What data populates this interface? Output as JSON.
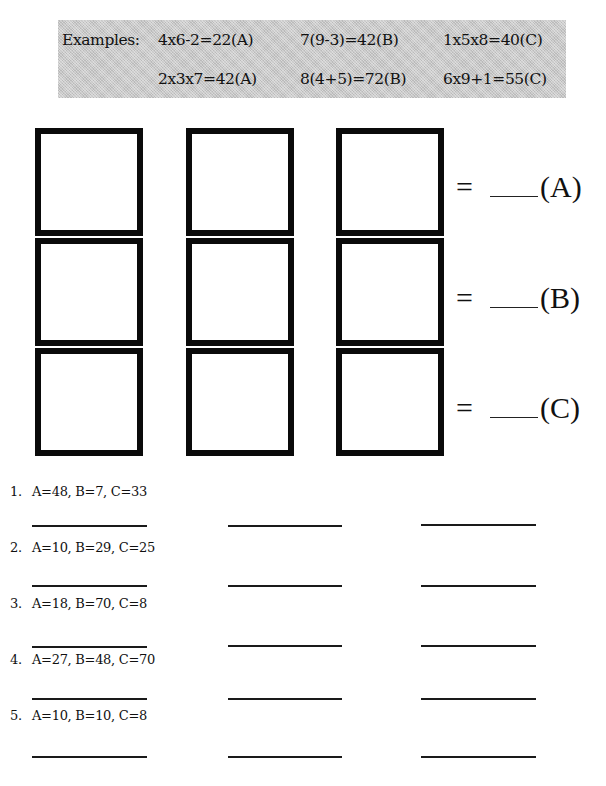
{
  "examples": {
    "label": "Examples:",
    "rows": [
      [
        "4x6-2=22(A)",
        "7(9-3)=42(B)",
        "1x5x8=40(C)"
      ],
      [
        "2x3x7=42(A)",
        "8(4+5)=72(B)",
        "6x9+1=55(C)"
      ]
    ]
  },
  "grid": {
    "rows": 3,
    "cols": 3,
    "equations": [
      {
        "sign": "=",
        "label": "(A)"
      },
      {
        "sign": "=",
        "label": "(B)"
      },
      {
        "sign": "=",
        "label": "(C)"
      }
    ]
  },
  "problems": [
    {
      "number": "1.",
      "text": "A=48, B=7, C=33"
    },
    {
      "number": "2.",
      "text": "A=10, B=29, C=25"
    },
    {
      "number": "3.",
      "text": "A=18, B=70, C=8"
    },
    {
      "number": "4.",
      "text": "A=27, B=48, C=70"
    },
    {
      "number": "5.",
      "text": "A=10, B=10, C=8"
    }
  ],
  "colors": {
    "box_border": "#0a0a0a",
    "examples_background": "#c9c9c9"
  }
}
